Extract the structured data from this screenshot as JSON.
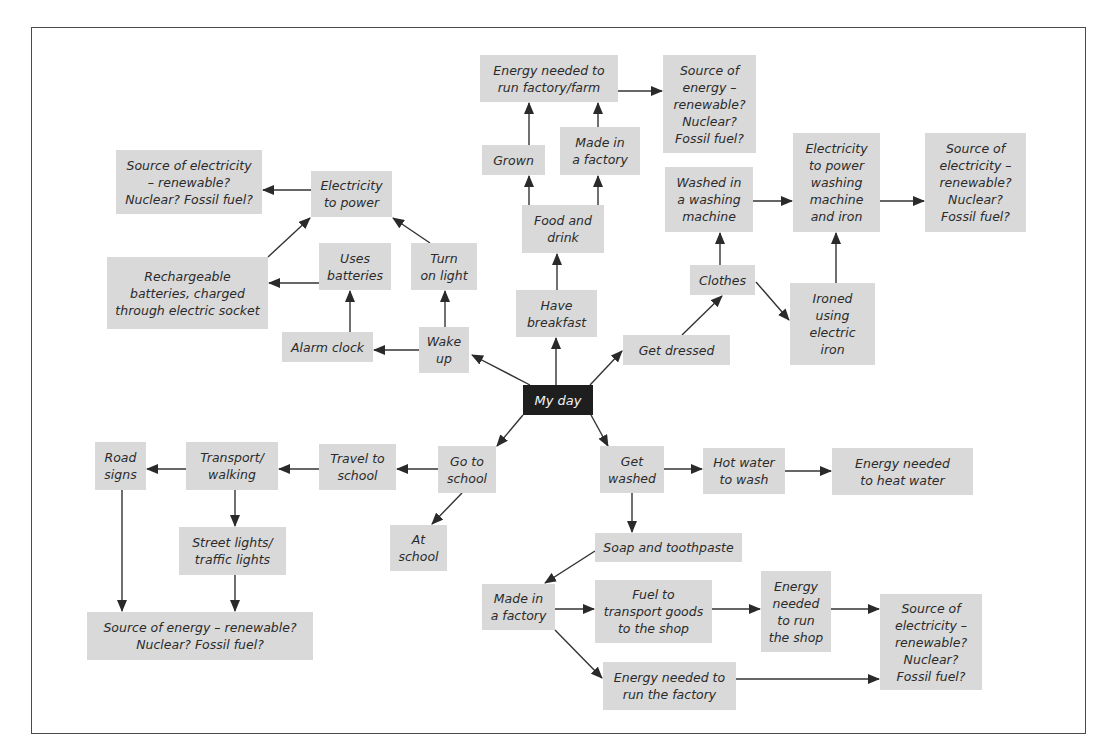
{
  "diagram": {
    "title": "My day",
    "colors": {
      "node_fill": "#d9d9d9",
      "center_fill": "#1e1e1e",
      "center_text": "#f2f2f2",
      "edge": "#333333",
      "frame": "#4a4a4a"
    },
    "nodes": [
      {
        "id": "my-day",
        "label": "My day",
        "x": 523,
        "y": 385,
        "w": 70,
        "h": 30,
        "center": true
      },
      {
        "id": "energy-factory-farm",
        "label": "Energy needed to\nrun factory/farm",
        "x": 480,
        "y": 55,
        "w": 138,
        "h": 47
      },
      {
        "id": "source-energy-top",
        "label": "Source of\nenergy –\nrenewable?\nNuclear?\nFossil fuel?",
        "x": 663,
        "y": 55,
        "w": 93,
        "h": 98
      },
      {
        "id": "grown",
        "label": "Grown",
        "x": 482,
        "y": 145,
        "w": 63,
        "h": 30
      },
      {
        "id": "made-in-factory-top",
        "label": "Made in\na factory",
        "x": 560,
        "y": 127,
        "w": 80,
        "h": 48
      },
      {
        "id": "food-and-drink",
        "label": "Food and\ndrink",
        "x": 522,
        "y": 205,
        "w": 82,
        "h": 48
      },
      {
        "id": "have-breakfast",
        "label": "Have\nbreakfast",
        "x": 516,
        "y": 290,
        "w": 81,
        "h": 47
      },
      {
        "id": "washed-machine",
        "label": "Washed in\na washing\nmachine",
        "x": 665,
        "y": 167,
        "w": 88,
        "h": 65
      },
      {
        "id": "electricity-washing-iron",
        "label": "Electricity\nto power\nwashing\nmachine\nand iron",
        "x": 793,
        "y": 133,
        "w": 87,
        "h": 99
      },
      {
        "id": "source-electricity-right-top",
        "label": "Source of\nelectricity –\nrenewable?\nNuclear?\nFossil fuel?",
        "x": 925,
        "y": 133,
        "w": 101,
        "h": 99
      },
      {
        "id": "clothes",
        "label": "Clothes",
        "x": 690,
        "y": 265,
        "w": 65,
        "h": 30
      },
      {
        "id": "ironed",
        "label": "Ironed\nusing\nelectric\niron",
        "x": 790,
        "y": 283,
        "w": 85,
        "h": 82
      },
      {
        "id": "get-dressed",
        "label": "Get dressed",
        "x": 623,
        "y": 335,
        "w": 107,
        "h": 30
      },
      {
        "id": "source-electricity-left",
        "label": "Source of electricity\n– renewable?\nNuclear? Fossil fuel?",
        "x": 116,
        "y": 150,
        "w": 146,
        "h": 64
      },
      {
        "id": "electricity-to-power",
        "label": "Electricity\nto power",
        "x": 311,
        "y": 171,
        "w": 81,
        "h": 46
      },
      {
        "id": "rechargeable-batteries",
        "label": "Rechargeable\nbatteries, charged\nthrough electric socket",
        "x": 107,
        "y": 257,
        "w": 161,
        "h": 72
      },
      {
        "id": "uses-batteries",
        "label": "Uses\nbatteries",
        "x": 319,
        "y": 243,
        "w": 72,
        "h": 47
      },
      {
        "id": "turn-on-light",
        "label": "Turn\non light",
        "x": 411,
        "y": 243,
        "w": 66,
        "h": 47
      },
      {
        "id": "alarm-clock",
        "label": "Alarm clock",
        "x": 282,
        "y": 332,
        "w": 91,
        "h": 30
      },
      {
        "id": "wake-up",
        "label": "Wake\nup",
        "x": 419,
        "y": 327,
        "w": 50,
        "h": 46
      },
      {
        "id": "go-to-school",
        "label": "Go to\nschool",
        "x": 438,
        "y": 446,
        "w": 58,
        "h": 47
      },
      {
        "id": "travel-to-school",
        "label": "Travel to\nschool",
        "x": 319,
        "y": 444,
        "w": 77,
        "h": 46
      },
      {
        "id": "transport-walking",
        "label": "Transport/\nwalking",
        "x": 186,
        "y": 442,
        "w": 92,
        "h": 48
      },
      {
        "id": "road-signs",
        "label": "Road\nsigns",
        "x": 95,
        "y": 442,
        "w": 51,
        "h": 48
      },
      {
        "id": "street-lights",
        "label": "Street lights/\ntraffic lights",
        "x": 179,
        "y": 527,
        "w": 107,
        "h": 48
      },
      {
        "id": "source-energy-bottom-left",
        "label": "Source of energy – renewable?\nNuclear? Fossil fuel?",
        "x": 87,
        "y": 612,
        "w": 226,
        "h": 48
      },
      {
        "id": "at-school",
        "label": "At\nschool",
        "x": 390,
        "y": 525,
        "w": 57,
        "h": 46
      },
      {
        "id": "get-washed",
        "label": "Get\nwashed",
        "x": 600,
        "y": 446,
        "w": 64,
        "h": 47
      },
      {
        "id": "hot-water",
        "label": "Hot water\nto wash",
        "x": 703,
        "y": 448,
        "w": 82,
        "h": 46
      },
      {
        "id": "energy-heat-water",
        "label": "Energy needed\nto heat water",
        "x": 832,
        "y": 448,
        "w": 141,
        "h": 47
      },
      {
        "id": "soap-toothpaste",
        "label": "Soap and toothpaste",
        "x": 595,
        "y": 533,
        "w": 147,
        "h": 29
      },
      {
        "id": "made-in-factory-bottom",
        "label": "Made in\na factory",
        "x": 482,
        "y": 584,
        "w": 73,
        "h": 46
      },
      {
        "id": "fuel-transport",
        "label": "Fuel to\ntransport goods\nto the shop",
        "x": 595,
        "y": 580,
        "w": 117,
        "h": 63
      },
      {
        "id": "energy-run-shop",
        "label": "Energy\nneeded\nto run\nthe shop",
        "x": 761,
        "y": 571,
        "w": 70,
        "h": 81
      },
      {
        "id": "source-electricity-bottom-right",
        "label": "Source of\nelectricity –\nrenewable?\nNuclear?\nFossil fuel?",
        "x": 880,
        "y": 594,
        "w": 102,
        "h": 96
      },
      {
        "id": "energy-run-factory",
        "label": "Energy needed to\nrun the factory",
        "x": 603,
        "y": 662,
        "w": 133,
        "h": 48
      }
    ],
    "edges": [
      {
        "from": "my-day",
        "to": "wake-up",
        "x1": 530,
        "y1": 385,
        "x2": 472,
        "y2": 355
      },
      {
        "from": "my-day",
        "to": "have-breakfast",
        "x1": 556,
        "y1": 385,
        "x2": 556,
        "y2": 338
      },
      {
        "from": "my-day",
        "to": "get-dressed",
        "x1": 590,
        "y1": 385,
        "x2": 622,
        "y2": 351
      },
      {
        "from": "my-day",
        "to": "go-to-school",
        "x1": 523,
        "y1": 415,
        "x2": 497,
        "y2": 446
      },
      {
        "from": "my-day",
        "to": "get-washed",
        "x1": 591,
        "y1": 415,
        "x2": 608,
        "y2": 446
      },
      {
        "from": "have-breakfast",
        "to": "food-and-drink",
        "x1": 557,
        "y1": 290,
        "x2": 557,
        "y2": 254
      },
      {
        "from": "food-and-drink",
        "to": "grown",
        "x1": 529,
        "y1": 205,
        "x2": 529,
        "y2": 176
      },
      {
        "from": "food-and-drink",
        "to": "made-in-factory-top",
        "x1": 598,
        "y1": 205,
        "x2": 598,
        "y2": 176
      },
      {
        "from": "grown",
        "to": "energy-factory-farm",
        "x1": 529,
        "y1": 145,
        "x2": 529,
        "y2": 103
      },
      {
        "from": "made-in-factory-top",
        "to": "energy-factory-farm",
        "x1": 598,
        "y1": 127,
        "x2": 598,
        "y2": 103
      },
      {
        "from": "energy-factory-farm",
        "to": "source-energy-top",
        "x1": 618,
        "y1": 91,
        "x2": 662,
        "y2": 91
      },
      {
        "from": "get-dressed",
        "to": "clothes",
        "x1": 682,
        "y1": 335,
        "x2": 722,
        "y2": 296
      },
      {
        "from": "clothes",
        "to": "washed-machine",
        "x1": 720,
        "y1": 265,
        "x2": 720,
        "y2": 233
      },
      {
        "from": "clothes",
        "to": "ironed",
        "x1": 756,
        "y1": 282,
        "x2": 789,
        "y2": 320
      },
      {
        "from": "washed-machine",
        "to": "electricity-washing-iron",
        "x1": 753,
        "y1": 201,
        "x2": 792,
        "y2": 201
      },
      {
        "from": "ironed",
        "to": "electricity-washing-iron",
        "x1": 836,
        "y1": 283,
        "x2": 836,
        "y2": 233
      },
      {
        "from": "electricity-washing-iron",
        "to": "source-electricity-right-top",
        "x1": 880,
        "y1": 201,
        "x2": 924,
        "y2": 201
      },
      {
        "from": "wake-up",
        "to": "alarm-clock",
        "x1": 419,
        "y1": 350,
        "x2": 374,
        "y2": 350
      },
      {
        "from": "wake-up",
        "to": "turn-on-light",
        "x1": 445,
        "y1": 327,
        "x2": 445,
        "y2": 291
      },
      {
        "from": "alarm-clock",
        "to": "uses-batteries",
        "x1": 350,
        "y1": 332,
        "x2": 350,
        "y2": 291
      },
      {
        "from": "uses-batteries",
        "to": "rechargeable-batteries",
        "x1": 319,
        "y1": 283,
        "x2": 269,
        "y2": 283
      },
      {
        "from": "turn-on-light",
        "to": "electricity-to-power",
        "x1": 430,
        "y1": 243,
        "x2": 393,
        "y2": 218
      },
      {
        "from": "rechargeable-batteries",
        "to": "electricity-to-power",
        "x1": 268,
        "y1": 257,
        "x2": 310,
        "y2": 218
      },
      {
        "from": "electricity-to-power",
        "to": "source-electricity-left",
        "x1": 311,
        "y1": 190,
        "x2": 263,
        "y2": 190
      },
      {
        "from": "go-to-school",
        "to": "travel-to-school",
        "x1": 438,
        "y1": 469,
        "x2": 397,
        "y2": 469
      },
      {
        "from": "go-to-school",
        "to": "at-school",
        "x1": 462,
        "y1": 493,
        "x2": 432,
        "y2": 524
      },
      {
        "from": "travel-to-school",
        "to": "transport-walking",
        "x1": 319,
        "y1": 469,
        "x2": 279,
        "y2": 469
      },
      {
        "from": "transport-walking",
        "to": "road-signs",
        "x1": 186,
        "y1": 469,
        "x2": 147,
        "y2": 469
      },
      {
        "from": "transport-walking",
        "to": "street-lights",
        "x1": 235,
        "y1": 490,
        "x2": 235,
        "y2": 526
      },
      {
        "from": "road-signs",
        "to": "source-energy-bottom-left",
        "x1": 122,
        "y1": 490,
        "x2": 122,
        "y2": 611
      },
      {
        "from": "street-lights",
        "to": "source-energy-bottom-left",
        "x1": 235,
        "y1": 575,
        "x2": 235,
        "y2": 611
      },
      {
        "from": "get-washed",
        "to": "hot-water",
        "x1": 664,
        "y1": 469,
        "x2": 702,
        "y2": 469
      },
      {
        "from": "hot-water",
        "to": "energy-heat-water",
        "x1": 785,
        "y1": 471,
        "x2": 831,
        "y2": 471
      },
      {
        "from": "get-washed",
        "to": "soap-toothpaste",
        "x1": 632,
        "y1": 493,
        "x2": 632,
        "y2": 532
      },
      {
        "from": "soap-toothpaste",
        "to": "made-in-factory-bottom",
        "x1": 595,
        "y1": 551,
        "x2": 545,
        "y2": 583
      },
      {
        "from": "made-in-factory-bottom",
        "to": "fuel-transport",
        "x1": 555,
        "y1": 609,
        "x2": 594,
        "y2": 609
      },
      {
        "from": "made-in-factory-bottom",
        "to": "energy-run-factory",
        "x1": 555,
        "y1": 630,
        "x2": 602,
        "y2": 678
      },
      {
        "from": "fuel-transport",
        "to": "energy-run-shop",
        "x1": 712,
        "y1": 609,
        "x2": 760,
        "y2": 609
      },
      {
        "from": "energy-run-shop",
        "to": "source-electricity-bottom-right",
        "x1": 831,
        "y1": 609,
        "x2": 879,
        "y2": 609
      },
      {
        "from": "energy-run-factory",
        "to": "source-electricity-bottom-right",
        "x1": 736,
        "y1": 679,
        "x2": 879,
        "y2": 679
      }
    ]
  }
}
